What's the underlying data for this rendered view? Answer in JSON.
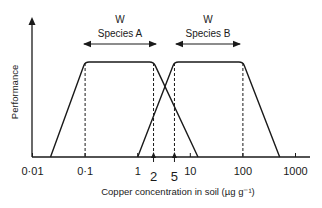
{
  "chart_data": {
    "type": "line",
    "title": "",
    "xlabel": "Copper concentration in soil (µg g⁻¹)",
    "ylabel": "Performance",
    "xscale": "log",
    "xlim": [
      0.01,
      1500
    ],
    "ylim": [
      0,
      1.15
    ],
    "grid": false,
    "legend": "none",
    "x_ticks": [
      {
        "value": 0.01,
        "label": "0·01"
      },
      {
        "value": 0.1,
        "label": "0·1"
      },
      {
        "value": 1,
        "label": "1"
      },
      {
        "value": 10,
        "label": "10"
      },
      {
        "value": 100,
        "label": "100"
      },
      {
        "value": 1000,
        "label": "1000"
      }
    ],
    "markers": [
      {
        "value": 2,
        "label": "2"
      },
      {
        "value": 5,
        "label": "5"
      }
    ],
    "series": [
      {
        "name": "Species A",
        "points": [
          [
            0.022,
            0
          ],
          [
            0.1,
            1
          ],
          [
            2,
            1
          ],
          [
            14,
            0
          ]
        ],
        "tolerance_range_label": "W",
        "tolerance_range": [
          0.1,
          2
        ]
      },
      {
        "name": "Species B",
        "points": [
          [
            1,
            0
          ],
          [
            5,
            1
          ],
          [
            100,
            1
          ],
          [
            500,
            0
          ]
        ],
        "tolerance_range_label": "W",
        "tolerance_range": [
          5,
          100
        ]
      }
    ],
    "dashed_guides": [
      0.1,
      2,
      5,
      100
    ]
  }
}
